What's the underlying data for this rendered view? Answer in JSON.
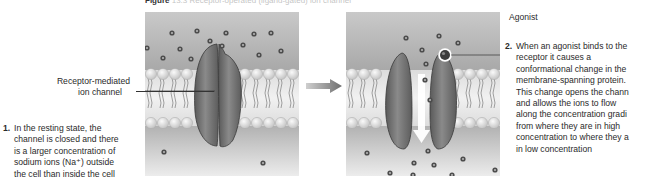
{
  "figure": {
    "title_prefix": "Figure",
    "title_rest": "13.3  Receptor-operated (ligand-gated) ion channel"
  },
  "labels": {
    "channel_line1": "Receptor-mediated",
    "channel_line2": "ion channel",
    "agonist": "Agonist"
  },
  "steps": [
    {
      "number": "1.",
      "lines": [
        "In the resting state, the",
        "channel is closed and there",
        "is a larger concentration of",
        "sodium ions (Na⁺) outside",
        "the cell than inside the cell"
      ]
    },
    {
      "number": "2.",
      "lines": [
        "When an agonist binds to the",
        "receptor it causes a",
        "conformational change in the",
        "membrane-spanning protein.",
        "This change opens the chann",
        "and allows the ions to flow",
        "along the concentration gradi",
        "from where they are in high",
        "concentration to where they a",
        "in low concentration"
      ]
    }
  ],
  "panels": {
    "resting": {
      "state": "closed",
      "ions_outside": 16,
      "ions_inside": 2
    },
    "activated": {
      "state": "open",
      "ions_outside": 5,
      "ions_in_channel": 3,
      "ions_inside": 10,
      "agonist_bound": true
    }
  },
  "colors": {
    "protein": "#6e6e6e",
    "protein_edge": "#3a3a3a",
    "membrane_head": "#d9d9d9",
    "background_top": "#b8b8b8",
    "background_bottom": "#e6e6e6",
    "ion": "#4a4a4a",
    "arrow": "#777777"
  }
}
